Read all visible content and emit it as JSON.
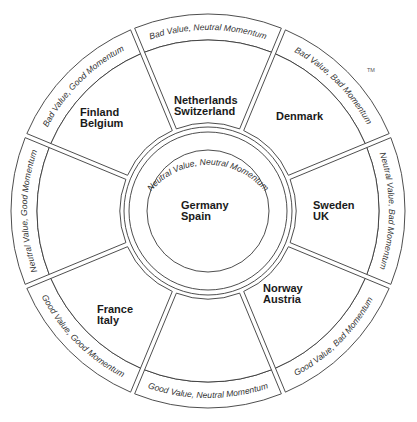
{
  "diagram": {
    "trademark": "TM",
    "center": {
      "band_label": "Neutral Value, Neutral Momentum",
      "countries": [
        "Germany",
        "Spain"
      ]
    },
    "segments": [
      {
        "id": "top",
        "angle": 0,
        "band_label": "Bad Value, Neutral Momentum",
        "countries": [
          "Netherlands",
          "Switzerland"
        ]
      },
      {
        "id": "top-right",
        "angle": 45,
        "band_label": "Bad Value, Bad Momentum",
        "countries": [
          "Denmark"
        ]
      },
      {
        "id": "right",
        "angle": 90,
        "band_label": "Neutral Value, Bad Momentum",
        "countries": [
          "Sweden",
          "UK"
        ]
      },
      {
        "id": "bottom-right",
        "angle": 135,
        "band_label": "Good Value, Bad Momentum",
        "countries": [
          "Norway",
          "Austria"
        ]
      },
      {
        "id": "bottom",
        "angle": 180,
        "band_label": "Good Value, Neutral Momentum",
        "countries": []
      },
      {
        "id": "bottom-left",
        "angle": 225,
        "band_label": "Good Value, Good Momentum",
        "countries": [
          "France",
          "Italy"
        ]
      },
      {
        "id": "left",
        "angle": 270,
        "band_label": "Neutral Value, Good Momentum",
        "countries": []
      },
      {
        "id": "top-left",
        "angle": 315,
        "band_label": "Bad Value, Good Momentum",
        "countries": [
          "Finland",
          "Belgium"
        ]
      }
    ],
    "colors": {
      "line": "#3a3a3a",
      "text": "#1a1a1a",
      "background": "#ffffff"
    }
  }
}
